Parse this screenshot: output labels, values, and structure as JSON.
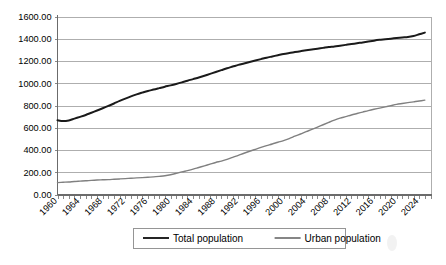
{
  "chart_data": {
    "type": "line",
    "title": "",
    "subtitle": "",
    "xlabel": "",
    "ylabel": "",
    "xlim": [
      1960,
      2026
    ],
    "ylim": [
      0,
      1600
    ],
    "ytick_step": 200,
    "xtick_step": 4,
    "grid": true,
    "legend_position": "bottom",
    "yticks": [
      "0.00",
      "200.00",
      "400.00",
      "600.00",
      "800.00",
      "1000.00",
      "1200.00",
      "1400.00",
      "1600.00"
    ],
    "ytick_values": [
      0,
      200,
      400,
      600,
      800,
      1000,
      1200,
      1400,
      1600
    ],
    "xticks": [
      "1960",
      "1964",
      "1968",
      "1972",
      "1976",
      "1980",
      "1984",
      "1988",
      "1992",
      "1996",
      "2000",
      "2004",
      "2008",
      "2012",
      "2016",
      "2020",
      "2024"
    ],
    "xtick_values": [
      1960,
      1964,
      1968,
      1972,
      1976,
      1980,
      1984,
      1988,
      1992,
      1996,
      2000,
      2004,
      2008,
      2012,
      2016,
      2020,
      2024
    ],
    "x": [
      1960,
      1961,
      1962,
      1963,
      1964,
      1965,
      1966,
      1967,
      1968,
      1969,
      1970,
      1971,
      1972,
      1973,
      1974,
      1975,
      1976,
      1977,
      1978,
      1979,
      1980,
      1981,
      1982,
      1983,
      1984,
      1985,
      1986,
      1987,
      1988,
      1989,
      1990,
      1991,
      1992,
      1993,
      1994,
      1995,
      1996,
      1997,
      1998,
      1999,
      2000,
      2001,
      2002,
      2003,
      2004,
      2005,
      2006,
      2007,
      2008,
      2009,
      2010,
      2011,
      2012,
      2013,
      2014,
      2015,
      2016,
      2017,
      2018,
      2019,
      2020,
      2021,
      2022,
      2023,
      2024,
      2025
    ],
    "series": [
      {
        "name": "Total population",
        "color": "#1a1a1a",
        "width": 2.0,
        "values": [
          667,
          660,
          666,
          682,
          698,
          715,
          735,
          755,
          775,
          796,
          818,
          841,
          862,
          882,
          900,
          916,
          931,
          943,
          956,
          969,
          981,
          994,
          1008,
          1023,
          1037,
          1051,
          1067,
          1084,
          1101,
          1118,
          1135,
          1150,
          1165,
          1178,
          1191,
          1204,
          1217,
          1230,
          1241,
          1252,
          1263,
          1272,
          1280,
          1288,
          1296,
          1304,
          1311,
          1318,
          1325,
          1331,
          1338,
          1345,
          1352,
          1360,
          1367,
          1375,
          1383,
          1390,
          1396,
          1401,
          1407,
          1412,
          1416,
          1425,
          1440,
          1455
        ]
      },
      {
        "name": "Urban population",
        "color": "#808080",
        "width": 1.4,
        "values": [
          107,
          110,
          113,
          117,
          120,
          123,
          127,
          130,
          132,
          134,
          137,
          140,
          143,
          146,
          149,
          152,
          155,
          158,
          163,
          169,
          178,
          190,
          203,
          215,
          228,
          243,
          258,
          273,
          288,
          300,
          315,
          334,
          352,
          371,
          389,
          406,
          423,
          439,
          454,
          470,
          485,
          503,
          524,
          544,
          565,
          585,
          606,
          627,
          648,
          668,
          686,
          700,
          715,
          728,
          741,
          754,
          766,
          777,
          788,
          799,
          810,
          818,
          826,
          833,
          840,
          848
        ]
      }
    ],
    "legend": [
      {
        "label": "Total population",
        "color": "#1a1a1a",
        "width": 2.0
      },
      {
        "label": "Urban population",
        "color": "#808080",
        "width": 1.4
      }
    ]
  }
}
